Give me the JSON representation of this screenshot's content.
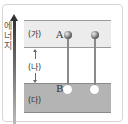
{
  "axis": {
    "label_chars": [
      "에",
      "너",
      "지"
    ]
  },
  "bands": {
    "top": {
      "label": "(가)"
    },
    "gap": {
      "label": "(나)"
    },
    "bottom": {
      "label": "(다)"
    }
  },
  "points": {
    "A": "A",
    "B": "B"
  }
}
